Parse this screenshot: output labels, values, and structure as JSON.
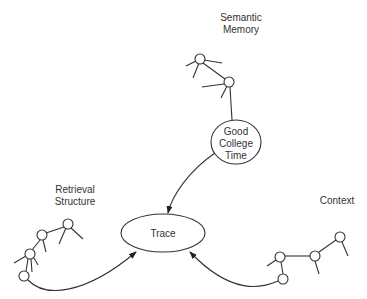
{
  "diagram": {
    "labels": {
      "semantic_memory": "Semantic\nMemory",
      "retrieval_structure": "Retrieval\nStructure",
      "context": "Context"
    },
    "nodes": {
      "good_college_time": [
        "Good",
        "College",
        "Time"
      ],
      "trace": "Trace"
    },
    "edges": [
      {
        "from": "Semantic Memory",
        "to": "Good College Time",
        "type": "line"
      },
      {
        "from": "Good College Time",
        "to": "Trace",
        "type": "arrow"
      },
      {
        "from": "Retrieval Structure",
        "to": "Trace",
        "type": "arrow"
      },
      {
        "from": "Context",
        "to": "Trace",
        "type": "arrow"
      }
    ],
    "colors": {
      "stroke": "#333333",
      "background": "#ffffff"
    }
  }
}
